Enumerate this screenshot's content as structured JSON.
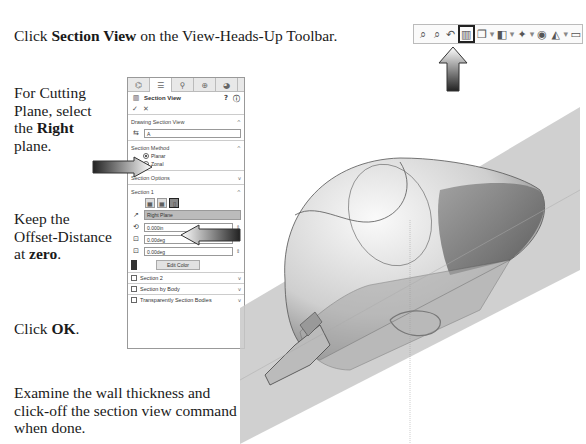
{
  "instructions": {
    "step1": {
      "prefix": "Click ",
      "bold": "Section View",
      "suffix": " on the View-Heads-Up Toolbar."
    },
    "step2": {
      "prefix": "For Cutting Plane, select the ",
      "bold": "Right",
      "suffix": " plane."
    },
    "step3": {
      "prefix": "Keep the Offset-Distance at ",
      "bold": "zero",
      "suffix": "."
    },
    "step4": {
      "prefix": "Click ",
      "bold": "OK",
      "suffix": "."
    },
    "step5": {
      "text": "Examine the wall thickness and click-off the section view command when done."
    }
  },
  "toolbar": {
    "icons": [
      "zoom-to-fit-icon",
      "zoom-to-area-icon",
      "previous-view-icon",
      "section-view-icon",
      "view-orientation-icon",
      "display-style-icon",
      "hide-show-icon",
      "edit-appearance-icon",
      "apply-scene-icon",
      "view-settings-icon"
    ],
    "selected": "section-view-icon"
  },
  "property_manager": {
    "tabs": [
      "feature-manager",
      "property-manager",
      "configuration-manager",
      "dimxpert-manager",
      "display-manager"
    ],
    "title": "Section View",
    "ok": "✓",
    "cancel": "✕",
    "drawing_section_view": {
      "label": "Drawing Section View",
      "value": "A"
    },
    "section_method": {
      "label": "Section Method",
      "options": [
        "Planar",
        "Zonal"
      ],
      "selected": "Planar"
    },
    "section_options": {
      "label": "Section Options"
    },
    "section1": {
      "label": "Section 1",
      "plane": "Right Plane",
      "offset": "0.000in",
      "rot_x": "0.00deg",
      "rot_y": "0.00deg",
      "edit_color": "Edit Color"
    },
    "section2": {
      "label": "Section 2"
    },
    "section_by_body": {
      "label": "Section by Body"
    },
    "transparently": {
      "label": "Transparently Section Bodies"
    }
  }
}
